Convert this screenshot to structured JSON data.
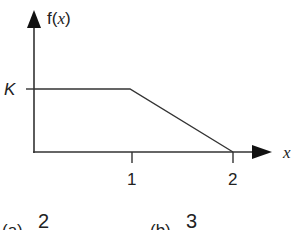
{
  "diagram": {
    "y_axis_label_prefix": "f(",
    "y_axis_label_var": "x",
    "y_axis_label_suffix": ")",
    "x_axis_label": "x",
    "level_label": "K",
    "x_ticks": [
      "1",
      "2"
    ],
    "line_color": "#333333",
    "segments": [
      {
        "from": [
          0,
          "K"
        ],
        "to": [
          1,
          "K"
        ]
      },
      {
        "from": [
          1,
          "K"
        ],
        "to": [
          2,
          0
        ]
      }
    ]
  },
  "options": [
    {
      "label": "(a)",
      "value": "2"
    },
    {
      "label": "(b)",
      "value": "3"
    }
  ]
}
